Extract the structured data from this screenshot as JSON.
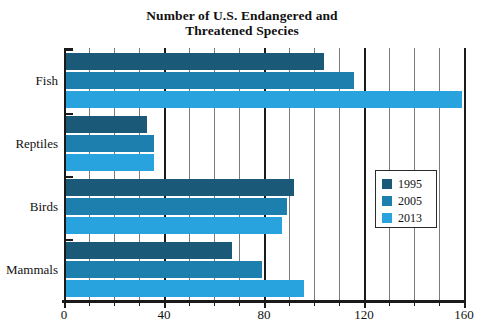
{
  "top_artifact": "",
  "chart_data": {
    "type": "bar",
    "orientation": "horizontal",
    "title_line1": "Number of U.S. Endangered and",
    "title_line2": "Threatened Species",
    "categories": [
      "Fish",
      "Reptiles",
      "Birds",
      "Mammals"
    ],
    "series": [
      {
        "name": "1995",
        "color": "#1a5a78",
        "values": [
          104,
          33,
          92,
          67
        ]
      },
      {
        "name": "2005",
        "color": "#1c7fad",
        "values": [
          116,
          36,
          89,
          79
        ]
      },
      {
        "name": "2013",
        "color": "#29a3dd",
        "values": [
          159,
          36,
          87,
          96
        ]
      }
    ],
    "xlabel": "",
    "ylabel": "",
    "xlim": [
      0,
      160
    ],
    "xticks_major": [
      0,
      40,
      80,
      120,
      160
    ],
    "xtick_labels": [
      "0",
      "40",
      "80",
      "120",
      "160"
    ],
    "xticks_minor_step": 10,
    "grid": "vertical",
    "legend_position": "center-right",
    "legend_entries": [
      "1995",
      "2005",
      "2013"
    ]
  }
}
